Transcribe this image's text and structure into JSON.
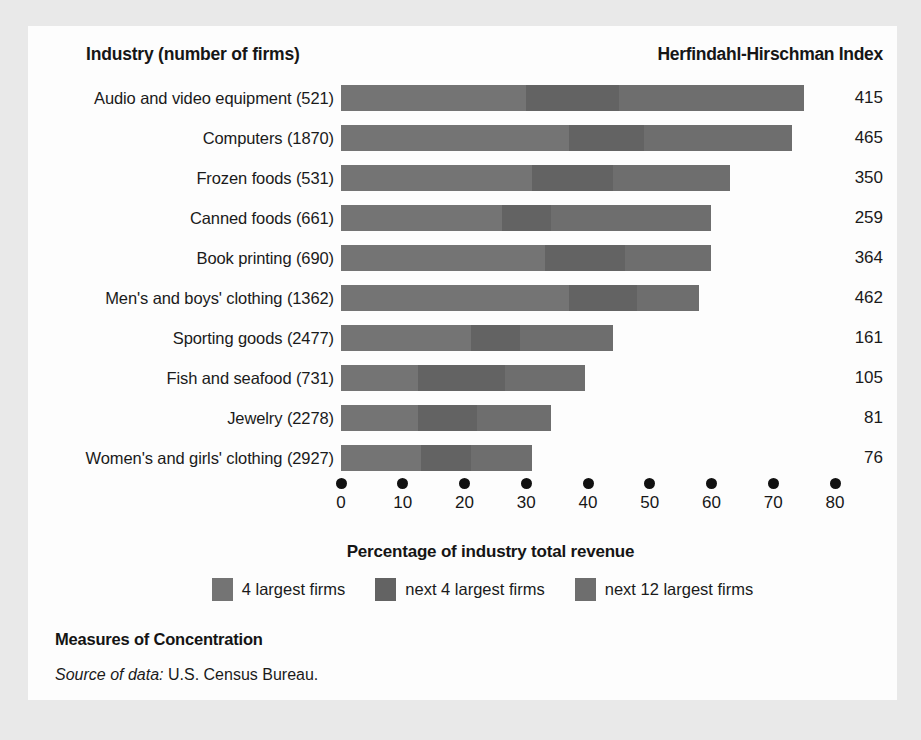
{
  "header": {
    "left_title": "Industry (number of firms)",
    "right_title": "Herfindahl-Hirschman Index"
  },
  "footer": {
    "title": "Measures of Concentration",
    "source_label": "Source of data:",
    "source_value": "U.S. Census Bureau."
  },
  "colors": {
    "segment_1": "#747474",
    "segment_2": "#636363",
    "segment_3": "#6e6e6e",
    "page_background": "#e9e9e9",
    "figure_background": "#fdfdfd",
    "text": "#1a1a1a"
  },
  "chart_data": {
    "type": "bar",
    "orientation": "horizontal",
    "stacked": true,
    "title": "Measures of Concentration",
    "xlabel": "Percentage of industry total revenue",
    "ylabel": "",
    "xlim": [
      0,
      80
    ],
    "xticks": [
      0,
      10,
      20,
      30,
      40,
      50,
      60,
      70,
      80
    ],
    "xtick_labels": [
      "0",
      "10",
      "20",
      "30",
      "40",
      "50",
      "60",
      "70",
      "80"
    ],
    "grid": false,
    "legend_position": "bottom",
    "legend": [
      "4 largest firms",
      "next 4 largest firms",
      "next 12 largest firms"
    ],
    "series": [
      {
        "name": "4 largest firms",
        "values": [
          30,
          37,
          31,
          26,
          33,
          37,
          21,
          12.5,
          12.5,
          13
        ]
      },
      {
        "name": "next 4 largest firms",
        "values": [
          15,
          12,
          13,
          8,
          13,
          11,
          8,
          14,
          9.5,
          8
        ]
      },
      {
        "name": "next 12 largest firms",
        "values": [
          30,
          24,
          19,
          26,
          14,
          10,
          15,
          13,
          12,
          10
        ]
      }
    ],
    "categories": [
      "Audio and video equipment  (521)",
      "Computers  (1870)",
      "Frozen foods  (531)",
      "Canned foods  (661)",
      "Book printing  (690)",
      "Men's and boys' clothing  (1362)",
      "Sporting goods  (2477)",
      "Fish and seafood  (731)",
      "Jewelry  (2278)",
      "Women's and girls' clothing  (2927)"
    ],
    "totals": [
      75,
      73,
      63,
      60,
      60,
      58,
      44,
      39.5,
      34,
      31
    ],
    "annotations_label": "Herfindahl-Hirschman Index",
    "annotations": [
      415,
      465,
      350,
      259,
      364,
      462,
      161,
      105,
      81,
      76
    ],
    "rows": [
      {
        "label": "Audio and video equipment  (521)",
        "s1": 30,
        "s2": 15,
        "s3": 30,
        "hhi": "415"
      },
      {
        "label": "Computers  (1870)",
        "s1": 37,
        "s2": 12,
        "s3": 24,
        "hhi": "465"
      },
      {
        "label": "Frozen foods  (531)",
        "s1": 31,
        "s2": 13,
        "s3": 19,
        "hhi": "350"
      },
      {
        "label": "Canned foods  (661)",
        "s1": 26,
        "s2": 8,
        "s3": 26,
        "hhi": "259"
      },
      {
        "label": "Book printing  (690)",
        "s1": 33,
        "s2": 13,
        "s3": 14,
        "hhi": "364"
      },
      {
        "label": "Men's and boys' clothing  (1362)",
        "s1": 37,
        "s2": 11,
        "s3": 10,
        "hhi": "462"
      },
      {
        "label": "Sporting goods  (2477)",
        "s1": 21,
        "s2": 8,
        "s3": 15,
        "hhi": "161"
      },
      {
        "label": "Fish and seafood  (731)",
        "s1": 12.5,
        "s2": 14,
        "s3": 13,
        "hhi": "105"
      },
      {
        "label": "Jewelry  (2278)",
        "s1": 12.5,
        "s2": 9.5,
        "s3": 12,
        "hhi": "81"
      },
      {
        "label": "Women's and girls' clothing  (2927)",
        "s1": 13,
        "s2": 8,
        "s3": 10,
        "hhi": "76"
      }
    ]
  }
}
